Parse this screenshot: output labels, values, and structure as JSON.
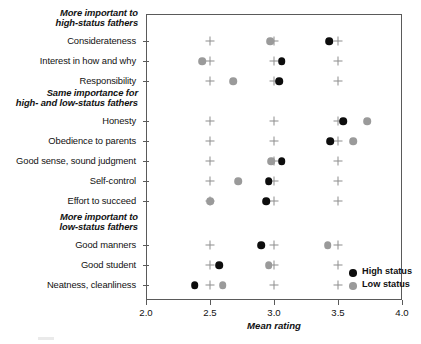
{
  "chart_data": {
    "type": "scatter",
    "title": "",
    "xlabel": "Mean rating",
    "ylabel": "",
    "xlim": [
      2.0,
      4.0
    ],
    "xticks": [
      "2.0",
      "2.5",
      "3.0",
      "3.5",
      "4.0"
    ],
    "xtick_values": [
      2.0,
      2.5,
      3.0,
      3.5,
      4.0
    ],
    "grid": false,
    "legend_position": "inside-bottom-right",
    "legend": [
      {
        "name": "High status",
        "color": "#0d0d0d",
        "marker": "filled-circle"
      },
      {
        "name": "Low status",
        "color": "#9a9a9a",
        "marker": "filled-circle"
      }
    ],
    "reference_marker": {
      "name": "cross",
      "color": "#8e8e8e",
      "values": [
        2.5,
        3.0,
        3.5
      ]
    },
    "group_headers": [
      {
        "line1": "More important to",
        "line2": "high-status fathers",
        "before_category": "Considerateness"
      },
      {
        "line1": "Same importance for",
        "line2": "high- and low-status fathers",
        "before_category": "Honesty"
      },
      {
        "line1": "More important to",
        "line2": "low-status fathers",
        "before_category": "Good manners"
      }
    ],
    "categories": [
      "Considerateness",
      "Interest in how and why",
      "Responsibility",
      "Honesty",
      "Obedience to parents",
      "Good sense, sound judgment",
      "Self-control",
      "Effort to succeed",
      "Good manners",
      "Good student",
      "Neatness, cleanliness"
    ],
    "series": [
      {
        "name": "High status",
        "color": "#0d0d0d",
        "values": [
          3.43,
          3.06,
          3.04,
          3.54,
          3.44,
          3.06,
          2.96,
          2.94,
          2.9,
          2.57,
          2.38
        ]
      },
      {
        "name": "Low status",
        "color": "#9a9a9a",
        "values": [
          2.97,
          2.44,
          2.68,
          3.73,
          3.62,
          2.98,
          2.72,
          2.5,
          3.42,
          2.96,
          2.6
        ]
      }
    ]
  }
}
